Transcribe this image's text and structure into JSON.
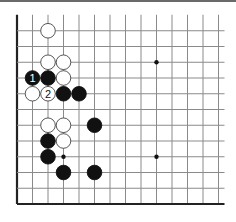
{
  "diagram": {
    "type": "go-board-fragment",
    "grid": {
      "origin_x": 17,
      "origin_y": 30.75,
      "col_spacing": 15.5,
      "row_spacing": 15.75,
      "cols": 14,
      "rows": 12,
      "open_top": true,
      "open_right": true,
      "left_edge": true,
      "bottom_edge": true
    },
    "colors": {
      "line": "#8a8a8a",
      "edge": "#222222",
      "black_stone": "#111111",
      "white_stone": "#ffffff",
      "stone_outline": "#444444"
    },
    "star_points": [
      {
        "col": 9,
        "row": 2
      },
      {
        "col": 9,
        "row": 8
      },
      {
        "col": 3,
        "row": 8
      }
    ],
    "stones": [
      {
        "color": "white",
        "col": 2,
        "row": 0,
        "label": ""
      },
      {
        "color": "white",
        "col": 2,
        "row": 2,
        "label": ""
      },
      {
        "color": "white",
        "col": 3,
        "row": 2,
        "label": ""
      },
      {
        "color": "black",
        "col": 1,
        "row": 3,
        "label": "1"
      },
      {
        "color": "black",
        "col": 2,
        "row": 3,
        "label": ""
      },
      {
        "color": "white",
        "col": 3,
        "row": 3,
        "label": ""
      },
      {
        "color": "white",
        "col": 1,
        "row": 4,
        "label": ""
      },
      {
        "color": "white",
        "col": 2,
        "row": 4,
        "label": "2"
      },
      {
        "color": "black",
        "col": 3,
        "row": 4,
        "label": ""
      },
      {
        "color": "black",
        "col": 4,
        "row": 4,
        "label": ""
      },
      {
        "color": "white",
        "col": 2,
        "row": 6,
        "label": ""
      },
      {
        "color": "white",
        "col": 3,
        "row": 6,
        "label": ""
      },
      {
        "color": "black",
        "col": 5,
        "row": 6,
        "label": ""
      },
      {
        "color": "black",
        "col": 2,
        "row": 7,
        "label": ""
      },
      {
        "color": "white",
        "col": 3,
        "row": 7,
        "label": ""
      },
      {
        "color": "black",
        "col": 2,
        "row": 8,
        "label": ""
      },
      {
        "color": "black",
        "col": 3,
        "row": 9,
        "label": ""
      },
      {
        "color": "black",
        "col": 5,
        "row": 9,
        "label": ""
      }
    ]
  }
}
